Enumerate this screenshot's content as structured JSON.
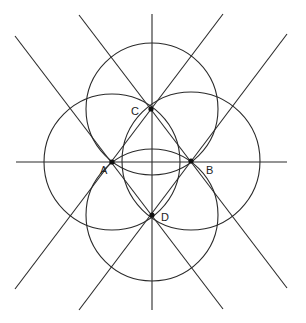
{
  "diagram": {
    "type": "geometric-construction",
    "points": [
      {
        "label": "A",
        "x": 112,
        "y": 162,
        "lx": 100,
        "ly": 174
      },
      {
        "label": "B",
        "x": 191,
        "y": 161,
        "lx": 206,
        "ly": 174
      },
      {
        "label": "C",
        "x": 151,
        "y": 109,
        "lx": 131,
        "ly": 115
      },
      {
        "label": "D",
        "x": 152,
        "y": 215,
        "lx": 161,
        "ly": 221
      }
    ],
    "circles": [
      {
        "name": "circle-center-c",
        "cx": 152,
        "cy": 109,
        "r": 66
      },
      {
        "name": "circle-center-d",
        "cx": 152,
        "cy": 215,
        "r": 66
      },
      {
        "name": "circle-center-a",
        "cx": 112,
        "cy": 162,
        "r": 68
      },
      {
        "name": "circle-center-b",
        "cx": 191,
        "cy": 161,
        "r": 69
      }
    ],
    "lines": [
      {
        "name": "vertical-axis",
        "x1": 152,
        "y1": 14,
        "x2": 152,
        "y2": 310
      },
      {
        "name": "horizontal-axis",
        "x1": 16,
        "y1": 162,
        "x2": 287,
        "y2": 162
      },
      {
        "name": "line-a-d",
        "x1": 15,
        "y1": 36,
        "x2": 223,
        "y2": 309
      },
      {
        "name": "line-c-b",
        "x1": 79,
        "y1": 15,
        "x2": 287,
        "y2": 288
      },
      {
        "name": "line-c-a",
        "x1": 223,
        "y1": 14,
        "x2": 15,
        "y2": 289
      },
      {
        "name": "line-b-d",
        "x1": 287,
        "y1": 34,
        "x2": 79,
        "y2": 310
      }
    ]
  }
}
